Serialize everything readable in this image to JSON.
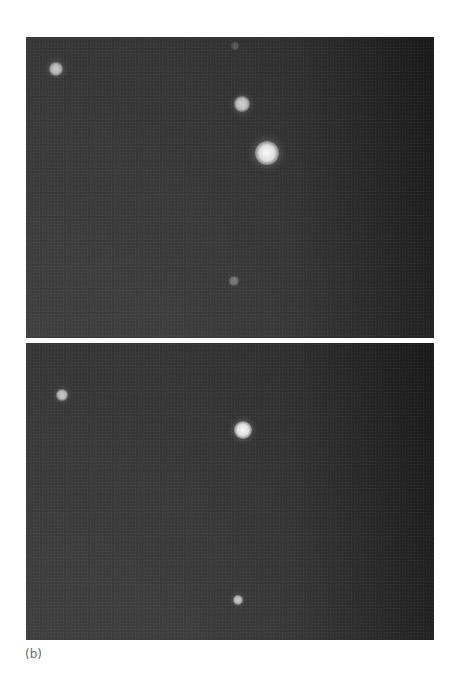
{
  "figure": {
    "caption": "(b)",
    "panels": [
      {
        "id": "top",
        "spots": [
          {
            "x": 30,
            "y": 32,
            "r": 7,
            "intensity": 0.75
          },
          {
            "x": 209,
            "y": 9,
            "r": 4,
            "intensity": 0.2
          },
          {
            "x": 216,
            "y": 67,
            "r": 8,
            "intensity": 0.8
          },
          {
            "x": 241,
            "y": 116,
            "r": 12,
            "intensity": 1.0
          },
          {
            "x": 208,
            "y": 244,
            "r": 5,
            "intensity": 0.35
          }
        ]
      },
      {
        "id": "bottom",
        "spots": [
          {
            "x": 36,
            "y": 52,
            "r": 6,
            "intensity": 0.75
          },
          {
            "x": 217,
            "y": 87,
            "r": 9,
            "intensity": 1.0
          },
          {
            "x": 212,
            "y": 257,
            "r": 5,
            "intensity": 0.75
          }
        ]
      }
    ]
  },
  "colors": {
    "background": "#ffffff",
    "panel_left": "#3b3b3b",
    "panel_right": "#1c1c1c",
    "spot": "#f4f4f4",
    "caption": "#6a6a6a"
  }
}
